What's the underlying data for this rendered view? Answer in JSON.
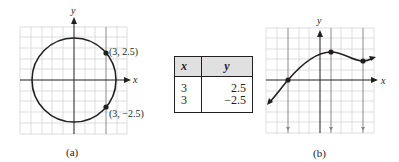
{
  "figure_a": {
    "caption": "(a)",
    "axis_x_label": "x",
    "axis_y_label": "y",
    "points": [
      {
        "label": "(3, 2.5)",
        "x": 3,
        "y": 2.5
      },
      {
        "label": "(3, −2.5)",
        "x": 3,
        "y": -2.5
      }
    ],
    "vertical_line_x": 3,
    "curve": "circle centered at origin, radius ≈ 3.9"
  },
  "table": {
    "headers": [
      "x",
      "y"
    ],
    "rows": [
      {
        "x": "3",
        "y": "2.5"
      },
      {
        "x": "3",
        "y": "−2.5"
      }
    ]
  },
  "figure_b": {
    "caption": "(b)",
    "axis_x_label": "x",
    "axis_y_label": "y",
    "vertical_lines_x": [
      -3,
      1,
      4
    ],
    "points": [
      {
        "x": -3,
        "y": 0
      },
      {
        "x": 1,
        "y": 2.6
      },
      {
        "x": 4,
        "y": 1.8
      }
    ],
    "curve": "function graph rising from lower-left, local max near x=1, local min near x=4"
  },
  "colors": {
    "ink": "#231f20",
    "grid": "#d4d4d4",
    "header_fill": "#e0e0e0",
    "vertical_line": "#8a8a8a"
  }
}
